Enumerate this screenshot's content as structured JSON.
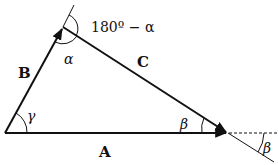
{
  "diagram": {
    "type": "vector-triangle",
    "vectors": [
      {
        "name": "A",
        "label": "A"
      },
      {
        "name": "B",
        "label": "B"
      },
      {
        "name": "C",
        "label": "C"
      }
    ],
    "angles": {
      "alpha": "α",
      "beta": "β",
      "beta_exterior": "β",
      "gamma": "γ",
      "exterior": "180º − α"
    },
    "colors": {
      "stroke": "#111111",
      "background": "#ffffff"
    }
  }
}
